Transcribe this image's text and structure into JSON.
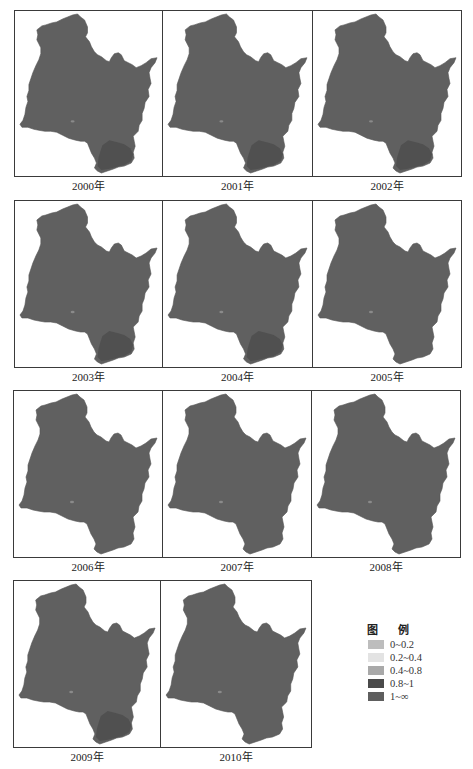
{
  "figure": {
    "map_fill": "#606060",
    "map_dark": "#4b4b4b",
    "panels": [
      {
        "year_label": "2000年",
        "x": 14,
        "y": 10,
        "w": 149,
        "h": 167,
        "dark_spot": "se"
      },
      {
        "year_label": "2001年",
        "x": 162,
        "y": 10,
        "w": 151,
        "h": 167,
        "dark_spot": "se"
      },
      {
        "year_label": "2002年",
        "x": 312,
        "y": 10,
        "w": 150,
        "h": 167,
        "dark_spot": "se"
      },
      {
        "year_label": "2003年",
        "x": 14,
        "y": 200,
        "w": 149,
        "h": 168,
        "dark_spot": "se"
      },
      {
        "year_label": "2004年",
        "x": 162,
        "y": 200,
        "w": 151,
        "h": 168,
        "dark_spot": "se"
      },
      {
        "year_label": "2005年",
        "x": 312,
        "y": 200,
        "w": 150,
        "h": 168,
        "dark_spot": "none"
      },
      {
        "year_label": "2006年",
        "x": 13,
        "y": 390,
        "w": 150,
        "h": 168,
        "dark_spot": "none"
      },
      {
        "year_label": "2007年",
        "x": 162,
        "y": 390,
        "w": 150,
        "h": 168,
        "dark_spot": "none"
      },
      {
        "year_label": "2008年",
        "x": 311,
        "y": 390,
        "w": 150,
        "h": 168,
        "dark_spot": "none"
      },
      {
        "year_label": "2009年",
        "x": 13,
        "y": 580,
        "w": 148,
        "h": 168,
        "dark_spot": "se"
      },
      {
        "year_label": "2010年",
        "x": 160,
        "y": 580,
        "w": 152,
        "h": 168,
        "dark_spot": "none"
      }
    ]
  },
  "legend": {
    "title": "图 例",
    "items": [
      {
        "label": "0~0.2",
        "color": "#bdbdbd"
      },
      {
        "label": "0.2~0.4",
        "color": "#e3e3e3"
      },
      {
        "label": "0.4~0.8",
        "color": "#a9a9a9"
      },
      {
        "label": "0.8~1",
        "color": "#4a4a4a"
      },
      {
        "label": "1~∞",
        "color": "#5e5e5e"
      }
    ]
  }
}
